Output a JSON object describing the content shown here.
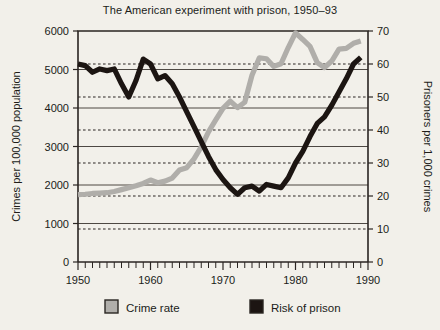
{
  "chart_data": {
    "type": "line",
    "title": "The American experiment with prison, 1950–93",
    "xlabel": "",
    "ylabel": "Crimes per 100,000 population",
    "y2label": "Prisoners per 1,000 crimes",
    "xlim": [
      1950,
      1990
    ],
    "ylim": [
      0,
      6000
    ],
    "y2lim": [
      0,
      70
    ],
    "xticks": [
      1950,
      1960,
      1970,
      1980,
      1990
    ],
    "xtick_labels": [
      "1950",
      "1960",
      "1970",
      "1980",
      "1990"
    ],
    "x_minor_tick_step": 1,
    "yticks": [
      0,
      1000,
      2000,
      3000,
      4000,
      5000,
      6000
    ],
    "ytick_labels": [
      "0",
      "1000",
      "2000",
      "3000",
      "4000",
      "5000",
      "6000"
    ],
    "y2ticks": [
      0,
      10,
      20,
      30,
      40,
      50,
      60,
      70
    ],
    "y2tick_labels": [
      "0",
      "10",
      "20",
      "30",
      "40",
      "50",
      "60",
      "70"
    ],
    "grid": {
      "left_axis_lines": "solid",
      "right_axis_lines": "dashed",
      "position": "horizontal-only"
    },
    "legend": {
      "position": "bottom-center",
      "entries": [
        {
          "label": "Crime rate",
          "color": "#b0aeaa",
          "swatch": "square"
        },
        {
          "label": "Risk of prison",
          "color": "#1c1512",
          "swatch": "square"
        }
      ]
    },
    "series": [
      {
        "name": "Crime rate",
        "axis": "left",
        "units": "crimes per 100,000 population",
        "color": "#b0aeaa",
        "x": [
          1950,
          1951,
          1952,
          1953,
          1954,
          1955,
          1956,
          1957,
          1958,
          1959,
          1960,
          1961,
          1962,
          1963,
          1964,
          1965,
          1966,
          1967,
          1968,
          1969,
          1970,
          1971,
          1972,
          1973,
          1974,
          1975,
          1976,
          1977,
          1978,
          1979,
          1980,
          1981,
          1982,
          1983,
          1984,
          1985,
          1986,
          1987,
          1988,
          1989
        ],
        "values": [
          1750,
          1760,
          1780,
          1790,
          1800,
          1830,
          1880,
          1930,
          1980,
          2040,
          2130,
          2060,
          2100,
          2180,
          2390,
          2450,
          2680,
          2990,
          3380,
          3690,
          3990,
          4180,
          4010,
          4150,
          4850,
          5300,
          5280,
          5080,
          5150,
          5570,
          5950,
          5780,
          5600,
          5180,
          5050,
          5220,
          5530,
          5550,
          5680,
          5740
        ]
      },
      {
        "name": "Risk of prison",
        "axis": "right",
        "units": "prisoners per 1,000 crimes",
        "color": "#1c1512",
        "x": [
          1950,
          1951,
          1952,
          1953,
          1954,
          1955,
          1956,
          1957,
          1958,
          1959,
          1960,
          1961,
          1962,
          1963,
          1964,
          1965,
          1966,
          1967,
          1968,
          1969,
          1970,
          1971,
          1972,
          1973,
          1974,
          1975,
          1976,
          1977,
          1978,
          1979,
          1980,
          1981,
          1982,
          1983,
          1984,
          1985,
          1986,
          1987,
          1988,
          1989
        ],
        "values": [
          60,
          59.5,
          57.5,
          58.5,
          58,
          58.5,
          54,
          50,
          55,
          61.5,
          60,
          55.5,
          56.5,
          54,
          50,
          45.5,
          41,
          36.5,
          32,
          28,
          25,
          22.5,
          20.5,
          22.5,
          23,
          21.5,
          23.5,
          23,
          22.5,
          25.5,
          30,
          33.5,
          38,
          42,
          44,
          47.5,
          51.5,
          55.5,
          60,
          62
        ]
      }
    ]
  }
}
